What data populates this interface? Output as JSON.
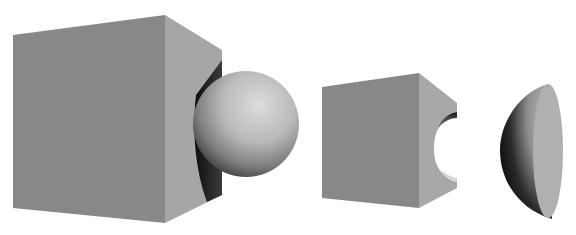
{
  "figure": {
    "background": "#ffffff",
    "colors": {
      "cube_front": "#8a8a8a",
      "cube_side": "#a9a9a9",
      "sphere_light": "#d9d9d9",
      "sphere_mid": "#a8a8a8",
      "sphere_dark": "#1a1a1a",
      "cap_flat": "#b3b3b3"
    },
    "objects": [
      {
        "id": "cube-with-sphere",
        "label": ""
      },
      {
        "id": "cube-with-cavity",
        "label": ""
      },
      {
        "id": "spherical-cap",
        "label": ""
      }
    ]
  }
}
